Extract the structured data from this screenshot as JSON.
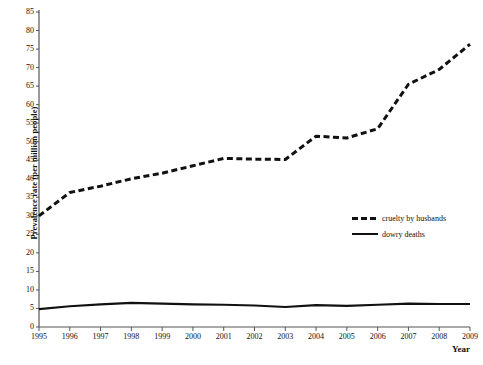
{
  "chart_data": {
    "type": "line",
    "title": "",
    "xlabel": "Year",
    "ylabel": "Prevalence rate (per million people)",
    "x": [
      1995,
      1996,
      1997,
      1998,
      1999,
      2000,
      2001,
      2002,
      2003,
      2004,
      2005,
      2006,
      2007,
      2008,
      2009
    ],
    "xlim": [
      1995,
      2009
    ],
    "ylim": [
      0,
      85
    ],
    "yticks": [
      0,
      5,
      10,
      15,
      20,
      25,
      30,
      35,
      40,
      45,
      50,
      55,
      60,
      65,
      70,
      75,
      80,
      85
    ],
    "xticks": [
      "1995",
      "1996",
      "1997",
      "1998",
      "1999",
      "2000",
      "2001",
      "2002",
      "2003",
      "2004",
      "2005",
      "2006",
      "2007",
      "2008",
      "2009"
    ],
    "grid": false,
    "legend_position": "center-right",
    "series": [
      {
        "name": "cruelty by husbands",
        "style": "dashed",
        "color": "#111111",
        "values": [
          30.0,
          36.3,
          38.0,
          40.0,
          41.5,
          43.5,
          45.5,
          45.3,
          45.2,
          51.5,
          51.0,
          53.5,
          65.5,
          69.5,
          76.3
        ]
      },
      {
        "name": "dowry deaths",
        "style": "solid",
        "color": "#111111",
        "values": [
          4.8,
          5.6,
          6.1,
          6.5,
          6.3,
          6.1,
          6.0,
          5.8,
          5.4,
          5.9,
          5.7,
          6.0,
          6.3,
          6.2,
          6.2
        ]
      }
    ]
  },
  "legend": {
    "items": [
      {
        "label": "cruelty by husbands",
        "style": "dashed"
      },
      {
        "label": "dowry deaths",
        "style": "solid"
      }
    ]
  }
}
